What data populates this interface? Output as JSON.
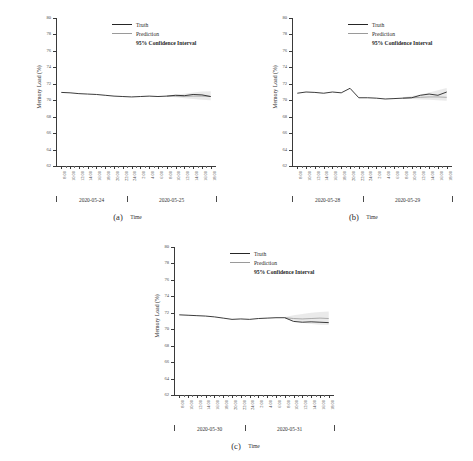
{
  "figure": {
    "axis_titles": {
      "x": "Time",
      "y": "Memory Load (%)"
    },
    "legend": {
      "truth_label": "Truth",
      "prediction_label": "Prediction",
      "ci_label": "95% Confidence Interval",
      "truth_color": "#262626",
      "prediction_color": "#9a9a9a",
      "ci_color": "#d9d9d9"
    },
    "hour_ticks": [
      "8:00",
      "10:00",
      "12:00",
      "14:00",
      "16:00",
      "18:00",
      "20:00",
      "22:00",
      "24:00",
      "2:00",
      "4:00",
      "6:00",
      "8:00",
      "10:00",
      "12:00",
      "14:00",
      "16:00",
      "18:00"
    ]
  },
  "chart_data": [
    {
      "type": "line",
      "panel": "a",
      "caption": "(a)",
      "title": "",
      "xlabel": "Time",
      "ylabel": "Memory Load (%)",
      "ylim": [
        62,
        80
      ],
      "yticks": [
        62,
        64,
        66,
        68,
        70,
        72,
        74,
        76,
        78,
        80
      ],
      "grid": false,
      "legend_position": "upper-center-right",
      "date_groups": [
        "2020-05-24",
        "2020-05-25"
      ],
      "x": [
        "8:00",
        "10:00",
        "12:00",
        "14:00",
        "16:00",
        "18:00",
        "20:00",
        "22:00",
        "24:00",
        "2:00",
        "4:00",
        "6:00",
        "8:00",
        "10:00",
        "12:00",
        "14:00",
        "16:00",
        "18:00"
      ],
      "forecast_start_index": 12,
      "series": [
        {
          "name": "Truth",
          "values": [
            70.95,
            70.9,
            70.8,
            70.75,
            70.7,
            70.6,
            70.5,
            70.45,
            70.4,
            70.45,
            70.5,
            70.45,
            70.5,
            70.6,
            70.55,
            70.7,
            70.65,
            70.45
          ]
        },
        {
          "name": "Prediction",
          "values": [
            null,
            null,
            null,
            null,
            null,
            null,
            null,
            null,
            null,
            null,
            null,
            null,
            70.5,
            70.5,
            70.48,
            70.5,
            70.5,
            70.45
          ]
        },
        {
          "name": "CI Upper",
          "values": [
            null,
            null,
            null,
            null,
            null,
            null,
            null,
            null,
            null,
            null,
            null,
            null,
            70.55,
            70.7,
            70.8,
            70.95,
            71.05,
            71.1
          ]
        },
        {
          "name": "CI Lower",
          "values": [
            null,
            null,
            null,
            null,
            null,
            null,
            null,
            null,
            null,
            null,
            null,
            null,
            70.45,
            70.35,
            70.25,
            70.15,
            70.05,
            70.0
          ]
        }
      ]
    },
    {
      "type": "line",
      "panel": "b",
      "caption": "(b)",
      "title": "",
      "xlabel": "Time",
      "ylabel": "Memory Load (%)",
      "ylim": [
        62,
        80
      ],
      "yticks": [
        62,
        64,
        66,
        68,
        70,
        72,
        74,
        76,
        78,
        80
      ],
      "grid": false,
      "legend_position": "upper-center-right",
      "date_groups": [
        "2020-05-28",
        "2020-05-29"
      ],
      "x": [
        "8:00",
        "10:00",
        "12:00",
        "14:00",
        "16:00",
        "18:00",
        "20:00",
        "22:00",
        "24:00",
        "2:00",
        "4:00",
        "6:00",
        "8:00",
        "10:00",
        "12:00",
        "14:00",
        "16:00",
        "18:00"
      ],
      "forecast_start_index": 12,
      "series": [
        {
          "name": "Truth",
          "values": [
            70.85,
            71.0,
            70.95,
            70.85,
            71.0,
            70.9,
            71.45,
            70.3,
            70.3,
            70.25,
            70.15,
            70.2,
            70.25,
            70.3,
            70.6,
            70.75,
            70.6,
            71.0
          ]
        },
        {
          "name": "Prediction",
          "values": [
            null,
            null,
            null,
            null,
            null,
            null,
            null,
            null,
            null,
            null,
            null,
            null,
            70.25,
            70.3,
            70.35,
            70.4,
            70.4,
            70.35
          ]
        },
        {
          "name": "CI Upper",
          "values": [
            null,
            null,
            null,
            null,
            null,
            null,
            null,
            null,
            null,
            null,
            null,
            null,
            70.35,
            70.5,
            70.7,
            70.95,
            71.2,
            71.5
          ]
        },
        {
          "name": "CI Lower",
          "values": [
            null,
            null,
            null,
            null,
            null,
            null,
            null,
            null,
            null,
            null,
            null,
            null,
            70.2,
            70.15,
            70.1,
            70.05,
            70.0,
            69.95
          ]
        }
      ]
    },
    {
      "type": "line",
      "panel": "c",
      "caption": "(c)",
      "title": "",
      "xlabel": "Time",
      "ylabel": "Memory Load (%)",
      "ylim": [
        62,
        80
      ],
      "yticks": [
        62,
        64,
        66,
        68,
        70,
        72,
        74,
        76,
        78,
        80
      ],
      "grid": false,
      "legend_position": "upper-center-right",
      "date_groups": [
        "2020-05-30",
        "2020-05-31"
      ],
      "x": [
        "8:00",
        "10:00",
        "12:00",
        "14:00",
        "16:00",
        "18:00",
        "20:00",
        "22:00",
        "24:00",
        "2:00",
        "4:00",
        "6:00",
        "8:00",
        "10:00",
        "12:00",
        "14:00",
        "16:00",
        "18:00"
      ],
      "forecast_start_index": 12,
      "series": [
        {
          "name": "Truth",
          "values": [
            71.75,
            71.7,
            71.65,
            71.6,
            71.5,
            71.35,
            71.2,
            71.25,
            71.2,
            71.3,
            71.35,
            71.4,
            71.4,
            70.95,
            70.85,
            70.9,
            70.85,
            70.8
          ]
        },
        {
          "name": "Prediction",
          "values": [
            null,
            null,
            null,
            null,
            null,
            null,
            null,
            null,
            null,
            null,
            null,
            null,
            71.4,
            71.3,
            71.25,
            71.3,
            71.35,
            71.3
          ]
        },
        {
          "name": "CI Upper",
          "values": [
            null,
            null,
            null,
            null,
            null,
            null,
            null,
            null,
            null,
            null,
            null,
            null,
            71.5,
            71.7,
            71.85,
            72.0,
            72.1,
            72.15
          ]
        },
        {
          "name": "CI Lower",
          "values": [
            null,
            null,
            null,
            null,
            null,
            null,
            null,
            null,
            null,
            null,
            null,
            null,
            71.3,
            71.0,
            70.8,
            70.65,
            70.55,
            70.5
          ]
        }
      ]
    }
  ]
}
